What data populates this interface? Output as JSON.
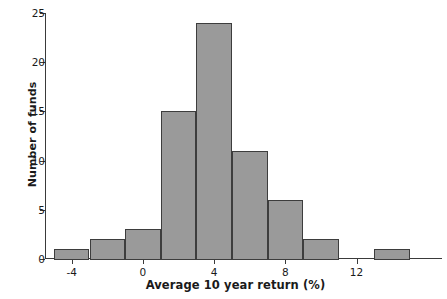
{
  "chart_data": {
    "type": "bar",
    "title": "",
    "subtitle": "",
    "xlabel": "Average 10 year return (%)",
    "ylabel": "Number of funds",
    "grid": false,
    "legend": false,
    "legend_position": "none",
    "bin_width": 2,
    "xlim": [
      -5.5,
      16.8
    ],
    "ylim": [
      0,
      25
    ],
    "x_ticks": [
      -4,
      0,
      4,
      8,
      12
    ],
    "x_tick_labels": [
      "-4",
      "0",
      "4",
      "8",
      "12"
    ],
    "y_ticks": [
      0,
      5,
      10,
      15,
      20,
      25
    ],
    "y_tick_labels": [
      "0",
      "5",
      "10",
      "15",
      "20",
      "25"
    ],
    "bin_edges": [
      -5,
      -3,
      -1,
      1,
      3,
      5,
      7,
      9,
      11,
      13,
      15
    ],
    "categories": [
      "-5 to -3",
      "-3 to -1",
      "-1 to 1",
      "1 to 3",
      "3 to 5",
      "5 to 7",
      "7 to 9",
      "9 to 11",
      "11 to 13",
      "13 to 15"
    ],
    "values": [
      1,
      2,
      3,
      15,
      24,
      11,
      6,
      2,
      0,
      1
    ],
    "bar_color": "#9a9a9a",
    "bar_edge_color": "#3d3d3d",
    "axis_color": "#3a3a3a"
  }
}
